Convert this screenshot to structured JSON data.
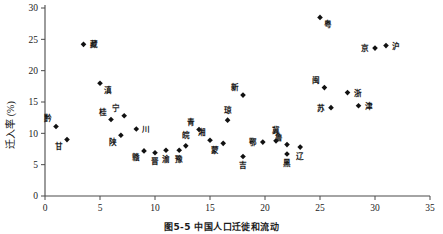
{
  "figure": {
    "caption": "图5-5  中国人口迁徙和流动",
    "width": 443,
    "height": 234
  },
  "chart_data": {
    "type": "scatter",
    "title": "",
    "xlabel": "",
    "ylabel": "迁入率 (%)",
    "xlim": [
      0,
      35
    ],
    "ylim": [
      0,
      30
    ],
    "xticks": [
      0,
      5,
      10,
      15,
      20,
      25,
      30,
      35
    ],
    "yticks": [
      0,
      5,
      10,
      15,
      20,
      25,
      30
    ],
    "grid": false,
    "legend": null,
    "marker_color": "#111111",
    "marker_shape": "diamond",
    "series": [
      {
        "name": "省区迁入率",
        "points": [
          {
            "label": "黔",
            "x": 1.0,
            "y": 11.1,
            "label_pos": "above-left"
          },
          {
            "label": "甘",
            "x": 2.0,
            "y": 9.0,
            "label_pos": "below-left"
          },
          {
            "label": "藏",
            "x": 3.5,
            "y": 24.2,
            "label_pos": "right"
          },
          {
            "label": "滇",
            "x": 5.0,
            "y": 18.0,
            "label_pos": "below-right"
          },
          {
            "label": "桂",
            "x": 6.0,
            "y": 12.2,
            "label_pos": "above-left"
          },
          {
            "label": "陕",
            "x": 6.9,
            "y": 9.7,
            "label_pos": "below-left"
          },
          {
            "label": "宁",
            "x": 7.2,
            "y": 12.8,
            "label_pos": "above-left"
          },
          {
            "label": "川",
            "x": 8.3,
            "y": 10.7,
            "label_pos": "right"
          },
          {
            "label": "赣",
            "x": 9.0,
            "y": 7.2,
            "label_pos": "below-left"
          },
          {
            "label": "晋",
            "x": 10.0,
            "y": 6.9,
            "label_pos": "below"
          },
          {
            "label": "渝",
            "x": 11.0,
            "y": 7.3,
            "label_pos": "below"
          },
          {
            "label": "豫",
            "x": 12.2,
            "y": 7.3,
            "label_pos": "below"
          },
          {
            "label": "皖",
            "x": 12.8,
            "y": 8.0,
            "label_pos": "above"
          },
          {
            "label": "青",
            "x": 14.0,
            "y": 10.6,
            "label_pos": "above-left"
          },
          {
            "label": "湘",
            "x": 15.0,
            "y": 8.9,
            "label_pos": "above-left"
          },
          {
            "label": "蒙",
            "x": 16.2,
            "y": 8.4,
            "label_pos": "below-left"
          },
          {
            "label": "琼",
            "x": 16.6,
            "y": 12.1,
            "label_pos": "above"
          },
          {
            "label": "新",
            "x": 18.0,
            "y": 16.1,
            "label_pos": "above-left"
          },
          {
            "label": "吉",
            "x": 18.0,
            "y": 6.3,
            "label_pos": "below"
          },
          {
            "label": "鄂",
            "x": 19.8,
            "y": 8.6,
            "label_pos": "left"
          },
          {
            "label": "冀",
            "x": 21.0,
            "y": 8.8,
            "label_pos": "above"
          },
          {
            "label": "鲁",
            "x": 22.0,
            "y": 8.2,
            "label_pos": "above-left"
          },
          {
            "label": "黑",
            "x": 22.0,
            "y": 6.7,
            "label_pos": "below"
          },
          {
            "label": "辽",
            "x": 23.2,
            "y": 7.8,
            "label_pos": "below"
          },
          {
            "label": "粤",
            "x": 25.0,
            "y": 28.5,
            "label_pos": "below-right"
          },
          {
            "label": "闽",
            "x": 25.4,
            "y": 17.3,
            "label_pos": "above-left"
          },
          {
            "label": "苏",
            "x": 26.0,
            "y": 14.1,
            "label_pos": "left"
          },
          {
            "label": "浙",
            "x": 27.5,
            "y": 16.5,
            "label_pos": "right"
          },
          {
            "label": "津",
            "x": 28.5,
            "y": 14.4,
            "label_pos": "right"
          },
          {
            "label": "京",
            "x": 30.0,
            "y": 23.6,
            "label_pos": "left"
          },
          {
            "label": "沪",
            "x": 31.0,
            "y": 24.0,
            "label_pos": "right"
          }
        ]
      }
    ]
  }
}
